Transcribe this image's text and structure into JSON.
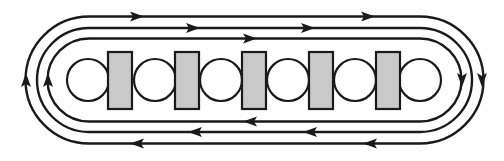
{
  "diagram": {
    "description": "Three concentric stadium-shaped loops with directional arrows circulating clockwise around a row of alternating circles and shaded rectangles",
    "colors": {
      "line": "#1a1a1a",
      "block_fill": "#c9c9c9",
      "circle_fill": "#ffffff",
      "background": "#ffffff"
    },
    "center_y": 80,
    "arc_centers_x": [
      89,
      420
    ],
    "loops": [
      {
        "name": "outer",
        "radius": 63.5,
        "arrows": [
          {
            "x": 137,
            "y": 16.5,
            "dir": "right"
          },
          {
            "x": 368,
            "y": 16.5,
            "dir": "right"
          },
          {
            "x": 482,
            "y": 80,
            "dir": "down"
          },
          {
            "x": 370,
            "y": 143.5,
            "dir": "left"
          },
          {
            "x": 137,
            "y": 143.5,
            "dir": "left"
          },
          {
            "x": 26,
            "y": 80,
            "dir": "up"
          }
        ]
      },
      {
        "name": "middle",
        "radius": 52,
        "arrows": [
          {
            "x": 193,
            "y": 28,
            "dir": "right"
          },
          {
            "x": 308,
            "y": 28,
            "dir": "right"
          },
          {
            "x": 310,
            "y": 132,
            "dir": "left"
          },
          {
            "x": 195,
            "y": 132,
            "dir": "left"
          }
        ]
      },
      {
        "name": "inner",
        "radius": 41.5,
        "arrows": [
          {
            "x": 250,
            "y": 38.5,
            "dir": "right"
          },
          {
            "x": 462,
            "y": 80,
            "dir": "down"
          },
          {
            "x": 250,
            "y": 121.5,
            "dir": "left"
          },
          {
            "x": 48,
            "y": 80,
            "dir": "up"
          }
        ]
      }
    ],
    "circles": [
      {
        "cx": 88,
        "r": 21
      },
      {
        "cx": 155,
        "r": 21
      },
      {
        "cx": 221,
        "r": 21
      },
      {
        "cx": 288,
        "r": 21
      },
      {
        "cx": 355,
        "r": 21
      },
      {
        "cx": 420,
        "r": 21
      }
    ],
    "blocks": [
      {
        "x": 108,
        "y": 52,
        "w": 24,
        "h": 57
      },
      {
        "x": 175,
        "y": 52,
        "w": 24,
        "h": 57
      },
      {
        "x": 242,
        "y": 52,
        "w": 24,
        "h": 57
      },
      {
        "x": 309,
        "y": 52,
        "w": 24,
        "h": 57
      },
      {
        "x": 376,
        "y": 52,
        "w": 24,
        "h": 57
      }
    ]
  }
}
